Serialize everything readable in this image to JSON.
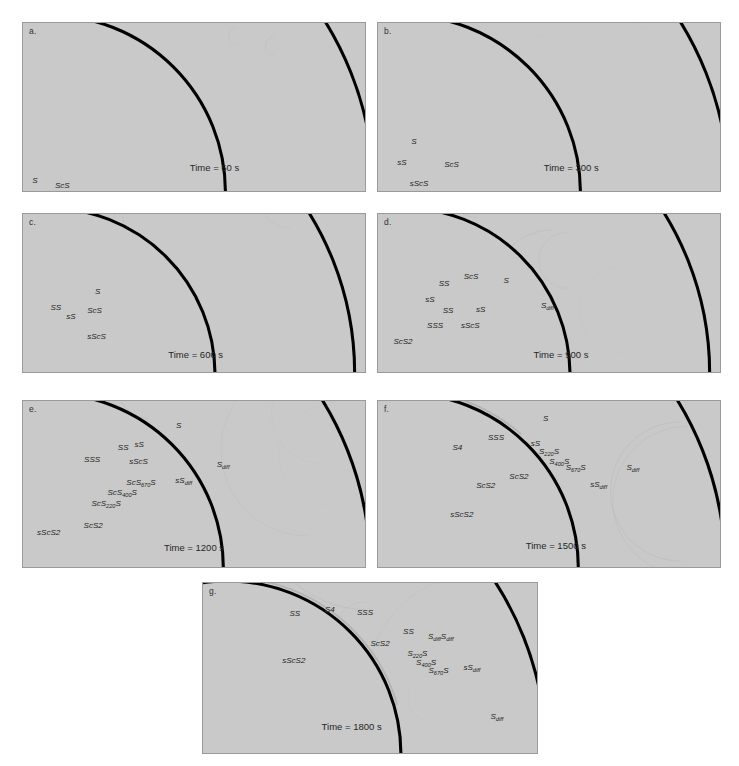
{
  "figure": {
    "type": "seismic-wavefield-snapshots",
    "background_color": "#ffffff",
    "panel_fill": "#c9c9c9",
    "panel_border": "#9a9a9a",
    "discontinuity_color": "#000000",
    "label_color": "#1c1c1c",
    "geometry_note": "half-annulus Earth cross-section; outer arc = surface, inner arc = core-mantle boundary; source at bottom-left on surface"
  },
  "panels": [
    {
      "id": "a",
      "letter": "a.",
      "time_label": "Time = 60 s",
      "time_seconds": 60,
      "rect": {
        "x": 22,
        "y": 22,
        "w": 344,
        "h": 170
      },
      "time_pos": {
        "x": 0.56,
        "y": 0.86
      },
      "phases": [
        {
          "text": "S",
          "sub": "",
          "tail": "",
          "x": 0.035,
          "y": 0.935
        },
        {
          "text": "ScS",
          "sub": "",
          "tail": "",
          "x": 0.115,
          "y": 0.965
        }
      ]
    },
    {
      "id": "b",
      "letter": "b.",
      "time_label": "Time = 300 s",
      "time_seconds": 300,
      "rect": {
        "x": 377,
        "y": 22,
        "w": 344,
        "h": 170
      },
      "time_pos": {
        "x": 0.565,
        "y": 0.855
      },
      "phases": [
        {
          "text": "S",
          "sub": "",
          "tail": "",
          "x": 0.105,
          "y": 0.7
        },
        {
          "text": "sS",
          "sub": "",
          "tail": "",
          "x": 0.07,
          "y": 0.83
        },
        {
          "text": "ScS",
          "sub": "",
          "tail": "",
          "x": 0.215,
          "y": 0.84
        },
        {
          "text": "sScS",
          "sub": "",
          "tail": "",
          "x": 0.12,
          "y": 0.955
        }
      ]
    },
    {
      "id": "c",
      "letter": "c.",
      "time_label": "Time = 600 s",
      "time_seconds": 600,
      "rect": {
        "x": 22,
        "y": 213,
        "w": 344,
        "h": 160
      },
      "time_pos": {
        "x": 0.505,
        "y": 0.885
      },
      "phases": [
        {
          "text": "S",
          "sub": "",
          "tail": "",
          "x": 0.218,
          "y": 0.487
        },
        {
          "text": "SS",
          "sub": "",
          "tail": "",
          "x": 0.096,
          "y": 0.588
        },
        {
          "text": "sS",
          "sub": "",
          "tail": "",
          "x": 0.14,
          "y": 0.648
        },
        {
          "text": "ScS",
          "sub": "",
          "tail": "",
          "x": 0.209,
          "y": 0.605
        },
        {
          "text": "sScS",
          "sub": "",
          "tail": "",
          "x": 0.215,
          "y": 0.775
        }
      ]
    },
    {
      "id": "d",
      "letter": "d.",
      "time_label": "Time = 900 s",
      "time_seconds": 900,
      "rect": {
        "x": 377,
        "y": 213,
        "w": 344,
        "h": 160
      },
      "time_pos": {
        "x": 0.535,
        "y": 0.885
      },
      "phases": [
        {
          "text": "SS",
          "sub": "",
          "tail": "",
          "x": 0.193,
          "y": 0.435
        },
        {
          "text": "ScS",
          "sub": "",
          "tail": "",
          "x": 0.272,
          "y": 0.395
        },
        {
          "text": "S",
          "sub": "",
          "tail": "",
          "x": 0.375,
          "y": 0.42
        },
        {
          "text": "sS",
          "sub": "",
          "tail": "",
          "x": 0.152,
          "y": 0.54
        },
        {
          "text": "SS",
          "sub": "",
          "tail": "",
          "x": 0.205,
          "y": 0.605
        },
        {
          "text": "sS",
          "sub": "",
          "tail": "",
          "x": 0.3,
          "y": 0.6
        },
        {
          "text": "S",
          "sub": "diff",
          "tail": "",
          "x": 0.495,
          "y": 0.58
        },
        {
          "text": "SSS",
          "sub": "",
          "tail": "",
          "x": 0.167,
          "y": 0.7
        },
        {
          "text": "sScS",
          "sub": "",
          "tail": "",
          "x": 0.27,
          "y": 0.7
        },
        {
          "text": "ScS2",
          "sub": "",
          "tail": "",
          "x": 0.073,
          "y": 0.805
        }
      ]
    },
    {
      "id": "e",
      "letter": "e.",
      "time_label": "Time = 1200 s",
      "time_seconds": 1200,
      "rect": {
        "x": 22,
        "y": 400,
        "w": 344,
        "h": 168
      },
      "time_pos": {
        "x": 0.5,
        "y": 0.88
      },
      "phases": [
        {
          "text": "S",
          "sub": "",
          "tail": "",
          "x": 0.455,
          "y": 0.145
        },
        {
          "text": "SS",
          "sub": "",
          "tail": "",
          "x": 0.293,
          "y": 0.28
        },
        {
          "text": "sS",
          "sub": "",
          "tail": "",
          "x": 0.34,
          "y": 0.262
        },
        {
          "text": "SSS",
          "sub": "",
          "tail": "",
          "x": 0.202,
          "y": 0.35
        },
        {
          "text": "sScS",
          "sub": "",
          "tail": "",
          "x": 0.338,
          "y": 0.36
        },
        {
          "text": "S",
          "sub": "diff",
          "tail": "",
          "x": 0.585,
          "y": 0.385
        },
        {
          "text": "ScS",
          "sub": "670",
          "tail": "S",
          "x": 0.345,
          "y": 0.495
        },
        {
          "text": "sS",
          "sub": "diff",
          "tail": "",
          "x": 0.47,
          "y": 0.48
        },
        {
          "text": "ScS",
          "sub": "400",
          "tail": "S",
          "x": 0.29,
          "y": 0.555
        },
        {
          "text": "ScS",
          "sub": "220",
          "tail": "S",
          "x": 0.243,
          "y": 0.62
        },
        {
          "text": "ScS2",
          "sub": "",
          "tail": "",
          "x": 0.205,
          "y": 0.745
        },
        {
          "text": "sScS2",
          "sub": "",
          "tail": "",
          "x": 0.075,
          "y": 0.79
        }
      ]
    },
    {
      "id": "f",
      "letter": "f.",
      "time_label": "Time = 1500 s",
      "time_seconds": 1500,
      "rect": {
        "x": 377,
        "y": 400,
        "w": 344,
        "h": 168
      },
      "time_pos": {
        "x": 0.52,
        "y": 0.87
      },
      "phases": [
        {
          "text": "S",
          "sub": "",
          "tail": "",
          "x": 0.49,
          "y": 0.105
        },
        {
          "text": "SSS",
          "sub": "",
          "tail": "",
          "x": 0.345,
          "y": 0.215
        },
        {
          "text": "S4",
          "sub": "",
          "tail": "",
          "x": 0.232,
          "y": 0.275
        },
        {
          "text": "sS",
          "sub": "",
          "tail": "",
          "x": 0.46,
          "y": 0.25
        },
        {
          "text": "S",
          "sub": "220",
          "tail": "S",
          "x": 0.5,
          "y": 0.305
        },
        {
          "text": "S",
          "sub": "400",
          "tail": "S",
          "x": 0.53,
          "y": 0.365
        },
        {
          "text": "S",
          "sub": "670",
          "tail": "S",
          "x": 0.578,
          "y": 0.405
        },
        {
          "text": "S",
          "sub": "diff",
          "tail": "",
          "x": 0.745,
          "y": 0.405
        },
        {
          "text": "ScS2",
          "sub": "",
          "tail": "",
          "x": 0.412,
          "y": 0.45
        },
        {
          "text": "sS",
          "sub": "diff",
          "tail": "",
          "x": 0.645,
          "y": 0.505
        },
        {
          "text": "ScS2",
          "sub": "",
          "tail": "",
          "x": 0.315,
          "y": 0.505
        },
        {
          "text": "sScS2",
          "sub": "",
          "tail": "",
          "x": 0.245,
          "y": 0.68
        }
      ]
    },
    {
      "id": "g",
      "letter": "g.",
      "time_label": "Time = 1800 s",
      "time_seconds": 1800,
      "rect": {
        "x": 202,
        "y": 582,
        "w": 336,
        "h": 172
      },
      "time_pos": {
        "x": 0.445,
        "y": 0.84
      },
      "phases": [
        {
          "text": "SS",
          "sub": "",
          "tail": "",
          "x": 0.275,
          "y": 0.175
        },
        {
          "text": "S4",
          "sub": "",
          "tail": "",
          "x": 0.38,
          "y": 0.155
        },
        {
          "text": "SSS",
          "sub": "",
          "tail": "",
          "x": 0.485,
          "y": 0.172
        },
        {
          "text": "SS",
          "sub": "",
          "tail": "",
          "x": 0.615,
          "y": 0.285
        },
        {
          "text": "S",
          "sub": "diff",
          "tail": "S",
          "x": 0.712,
          "y": 0.318,
          "tail_sub": "diff"
        },
        {
          "text": "ScS2",
          "sub": "",
          "tail": "",
          "x": 0.53,
          "y": 0.355
        },
        {
          "text": "S",
          "sub": "220",
          "tail": "S",
          "x": 0.642,
          "y": 0.418
        },
        {
          "text": "sScS2",
          "sub": "",
          "tail": "",
          "x": 0.272,
          "y": 0.45
        },
        {
          "text": "S",
          "sub": "400",
          "tail": "S",
          "x": 0.668,
          "y": 0.468
        },
        {
          "text": "S",
          "sub": "670",
          "tail": "S",
          "x": 0.705,
          "y": 0.52
        },
        {
          "text": "sS",
          "sub": "diff",
          "tail": "",
          "x": 0.805,
          "y": 0.5
        },
        {
          "text": "S",
          "sub": "diff",
          "tail": "",
          "x": 0.88,
          "y": 0.79
        }
      ]
    }
  ]
}
